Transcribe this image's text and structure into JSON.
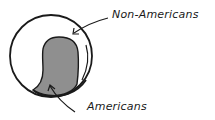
{
  "diagram": {
    "type": "venn-like population circle",
    "style": "hand-drawn",
    "colors": {
      "background": "#ffffff",
      "stroke": "#1a1a1a",
      "americans_fill": "#8f8f8f"
    },
    "regions": [
      {
        "id": "non-americans",
        "label": "Non-Americans",
        "fill": "#ffffff"
      },
      {
        "id": "americans",
        "label": "Americans",
        "fill": "#8f8f8f"
      }
    ],
    "labels": {
      "non_americans": "Non-Americans",
      "americans": "Americans"
    }
  }
}
